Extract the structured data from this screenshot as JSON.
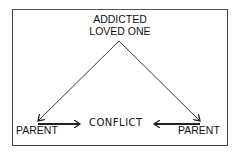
{
  "diagram": {
    "top_node": {
      "line1": "ADDICTED",
      "line2": "LOVED ONE"
    },
    "left_node": "PARENT",
    "right_node": "PARENT",
    "center_label": "CONFLICT"
  },
  "colors": {
    "line": "#222222",
    "background": "#ffffff",
    "frame": "#444444"
  }
}
